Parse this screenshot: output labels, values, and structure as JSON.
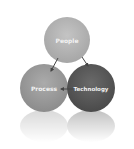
{
  "diagram": {
    "type": "cycle-venn",
    "nodes": [
      {
        "id": "people",
        "label": "People",
        "color": "#b3b3b3",
        "cx": 67,
        "cy": 40,
        "r": 23
      },
      {
        "id": "process",
        "label": "Process",
        "color": "#9a9a9a",
        "cx": 44,
        "cy": 88,
        "r": 24
      },
      {
        "id": "technology",
        "label": "Technology",
        "color": "#5a5a5a",
        "cx": 91,
        "cy": 88,
        "r": 24
      }
    ],
    "edges": [
      {
        "from": "people",
        "to": "process"
      },
      {
        "from": "technology",
        "to": "process"
      },
      {
        "from": "people",
        "to": "technology"
      }
    ],
    "colors": {
      "background": "#ffffff",
      "label": "#f2f2f2",
      "arrow": "#444444"
    }
  }
}
